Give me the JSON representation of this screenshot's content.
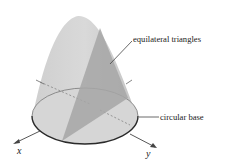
{
  "diagram": {
    "labels": {
      "triangles": "equilateral triangles",
      "base": "circular base",
      "x_axis": "x",
      "y_axis": "y"
    },
    "colors": {
      "solid_fill": "#c8c8c8",
      "solid_light": "#dcdcdc",
      "triangle_fill": "#a6a6a6",
      "base_fill": "#d6d6d6",
      "base_outline": "#2a2a2a",
      "axis": "#444444",
      "text": "#222222"
    }
  }
}
